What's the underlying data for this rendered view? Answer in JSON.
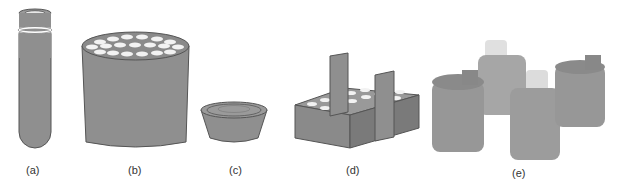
{
  "figure": {
    "panels": [
      {
        "id": "a",
        "label": "(a)",
        "subject": "centrifuge tube"
      },
      {
        "id": "b",
        "label": "(b)",
        "subject": "multi-hole adapter block (tapered)"
      },
      {
        "id": "c",
        "label": "(c)",
        "subject": "shallow bowl adapter"
      },
      {
        "id": "d",
        "label": "(d)",
        "subject": "rectangular rack with handles"
      },
      {
        "id": "e",
        "label": "(e)",
        "subject": "cylindrical bucket adapters with bottles"
      }
    ],
    "colors": {
      "fill": "#8f8f8f",
      "dark": "#6a6a6a",
      "hole": "#f2f2f2",
      "outline": "#555555",
      "bucket": "#9a9a9a",
      "bottle": "#d8d8d8"
    }
  }
}
